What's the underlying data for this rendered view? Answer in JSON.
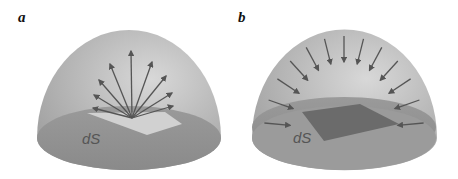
{
  "figure": {
    "panels": [
      {
        "id": "a",
        "label": "a",
        "surface_label": "dS",
        "arrow_direction": "outward",
        "arrow_count": 9,
        "surface_shade": "light"
      },
      {
        "id": "b",
        "label": "b",
        "surface_label": "dS",
        "arrow_direction": "inward",
        "arrow_count": 13,
        "surface_shade": "dark"
      }
    ],
    "colors": {
      "dome": "#b8b8b8",
      "base": "#8f8f8f",
      "arrow": "#555555",
      "surface_light": "#d6d6d6",
      "surface_dark": "#6e6e6e"
    }
  }
}
